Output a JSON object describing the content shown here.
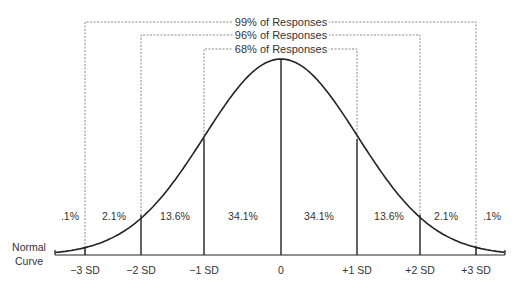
{
  "diagram": {
    "title": "Normal Curve",
    "title_lines": [
      "Normal",
      "Curve"
    ],
    "colors": {
      "line": "#222222",
      "dashed": "#888888",
      "text": "#333333",
      "background": "#ffffff"
    },
    "ranges": [
      {
        "label": "99% of Responses",
        "from": "-3 SD",
        "to": "+3 SD"
      },
      {
        "label": "96% of Responses",
        "from": "-2 SD",
        "to": "+2 SD"
      },
      {
        "label": "68% of Responses",
        "from": "-1 SD",
        "to": "+1 SD"
      }
    ],
    "sd_labels": [
      "−3 SD",
      "−2 SD",
      "−1 SD",
      "0",
      "+1 SD",
      "+2 SD",
      "+3 SD"
    ],
    "segment_percents": [
      ".1%",
      "2.1%",
      "13.6%",
      "34.1%",
      "34.1%",
      "13.6%",
      "2.1%",
      ".1%"
    ]
  },
  "chart_data": {
    "type": "area",
    "title": "Normal Curve",
    "x": [
      -3,
      -2,
      -1,
      0,
      1,
      2,
      3
    ],
    "xlabels": [
      "−3 SD",
      "−2 SD",
      "−1 SD",
      "0",
      "+1 SD",
      "+2 SD",
      "+3 SD"
    ],
    "segments": [
      {
        "range": "< -3 SD",
        "percent": 0.1
      },
      {
        "range": "-3 to -2 SD",
        "percent": 2.1
      },
      {
        "range": "-2 to -1 SD",
        "percent": 13.6
      },
      {
        "range": "-1 to 0 SD",
        "percent": 34.1
      },
      {
        "range": "0 to +1 SD",
        "percent": 34.1
      },
      {
        "range": "+1 to +2 SD",
        "percent": 13.6
      },
      {
        "range": "+2 to +3 SD",
        "percent": 2.1
      },
      {
        "range": "> +3 SD",
        "percent": 0.1
      }
    ],
    "annotations": [
      "99% of Responses",
      "96% of Responses",
      "68% of Responses"
    ],
    "grid": false
  }
}
